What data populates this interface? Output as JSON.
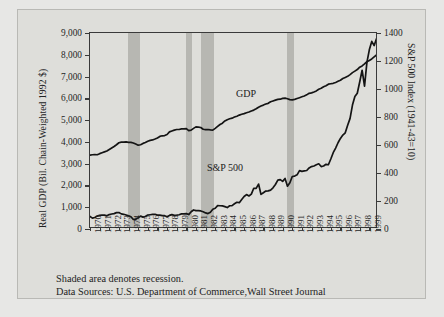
{
  "figure": {
    "labels": {
      "gdp_series_label": "GDP",
      "sp_series_label": "S&P 500"
    },
    "notes": {
      "line1": "Shaded area denotes recession.",
      "line2": "Data Sources: U.S. Department of Commerce,Wall Street Journal"
    },
    "colors": {
      "panel_background": "#dededa",
      "page_background": "#e7e7e5",
      "recession_band": "#b7b7b2",
      "line": "#141414",
      "axis": "#3a3a3a"
    }
  },
  "chart_data": {
    "type": "line",
    "title": "",
    "xlabel": "",
    "ylabel": "Real GDP (Bil. Chain-Weighted 1992 $)",
    "y2label": "S&P 500 Index (1941-43=10)",
    "grid": false,
    "legend": "inline-annotations",
    "xlim": [
      1970,
      1999.9
    ],
    "ylim": [
      0,
      9000
    ],
    "y2lim": [
      0,
      1400
    ],
    "yticks": [
      0,
      1000,
      2000,
      3000,
      4000,
      5000,
      6000,
      7000,
      8000,
      9000
    ],
    "yticklabels": [
      "0",
      "1,000",
      "2,000",
      "3,000",
      "4,000",
      "5,000",
      "6,000",
      "7,000",
      "8,000",
      "9,000"
    ],
    "y2ticks": [
      0,
      200,
      400,
      600,
      800,
      1000,
      1200,
      1400
    ],
    "y2ticklabels": [
      "0",
      "200",
      "400",
      "600",
      "800",
      "1000",
      "1200",
      "1400"
    ],
    "xticklabels": [
      "1970",
      "1971",
      "1972",
      "1973",
      "1974",
      "1975",
      "1976",
      "1977",
      "1978",
      "1979",
      "1980",
      "1981",
      "1982",
      "1983",
      "1984",
      "1985",
      "1986",
      "1987",
      "1988",
      "1989",
      "1990",
      "1991",
      "1992",
      "1993",
      "1994",
      "1995",
      "1996",
      "1997",
      "1998",
      "1999"
    ],
    "recessions": [
      {
        "start": 1973.9,
        "end": 1975.2
      },
      {
        "start": 1980.0,
        "end": 1980.6
      },
      {
        "start": 1981.5,
        "end": 1982.9
      },
      {
        "start": 1990.5,
        "end": 1991.2
      }
    ],
    "series": [
      {
        "name": "GDP",
        "axis": "left",
        "units": "Bil. Chain-Weighted 1992 $",
        "x": [
          1970.0,
          1970.25,
          1970.5,
          1970.75,
          1971.0,
          1971.25,
          1971.5,
          1971.75,
          1972.0,
          1972.25,
          1972.5,
          1972.75,
          1973.0,
          1973.25,
          1973.5,
          1973.75,
          1974.0,
          1974.25,
          1974.5,
          1974.75,
          1975.0,
          1975.25,
          1975.5,
          1975.75,
          1976.0,
          1976.25,
          1976.5,
          1976.75,
          1977.0,
          1977.25,
          1977.5,
          1977.75,
          1978.0,
          1978.25,
          1978.5,
          1978.75,
          1979.0,
          1979.25,
          1979.5,
          1979.75,
          1980.0,
          1980.25,
          1980.5,
          1980.75,
          1981.0,
          1981.25,
          1981.5,
          1981.75,
          1982.0,
          1982.25,
          1982.5,
          1982.75,
          1983.0,
          1983.25,
          1983.5,
          1983.75,
          1984.0,
          1984.25,
          1984.5,
          1984.75,
          1985.0,
          1985.25,
          1985.5,
          1985.75,
          1986.0,
          1986.25,
          1986.5,
          1986.75,
          1987.0,
          1987.25,
          1987.5,
          1987.75,
          1988.0,
          1988.25,
          1988.5,
          1988.75,
          1989.0,
          1989.25,
          1989.5,
          1989.75,
          1990.0,
          1990.25,
          1990.5,
          1990.75,
          1991.0,
          1991.25,
          1991.5,
          1991.75,
          1992.0,
          1992.25,
          1992.5,
          1992.75,
          1993.0,
          1993.25,
          1993.5,
          1993.75,
          1994.0,
          1994.25,
          1994.5,
          1994.75,
          1995.0,
          1995.25,
          1995.5,
          1995.75,
          1996.0,
          1996.25,
          1996.5,
          1996.75,
          1997.0,
          1997.25,
          1997.5,
          1997.75,
          1998.0,
          1998.25,
          1998.5,
          1998.75,
          1999.0,
          1999.25,
          1999.5,
          1999.75
        ],
        "y": [
          3390,
          3410,
          3420,
          3410,
          3460,
          3500,
          3540,
          3580,
          3650,
          3720,
          3790,
          3870,
          3960,
          3990,
          3990,
          4000,
          3980,
          3980,
          3950,
          3900,
          3850,
          3870,
          3930,
          3970,
          4030,
          4070,
          4090,
          4130,
          4180,
          4250,
          4280,
          4290,
          4340,
          4460,
          4500,
          4540,
          4570,
          4570,
          4600,
          4600,
          4610,
          4520,
          4540,
          4620,
          4690,
          4680,
          4660,
          4580,
          4560,
          4570,
          4550,
          4540,
          4620,
          4710,
          4800,
          4860,
          4960,
          5020,
          5060,
          5090,
          5140,
          5180,
          5230,
          5270,
          5300,
          5340,
          5370,
          5420,
          5460,
          5520,
          5590,
          5650,
          5690,
          5740,
          5770,
          5840,
          5880,
          5920,
          5950,
          5960,
          6000,
          6010,
          5980,
          5940,
          5930,
          5950,
          5990,
          6030,
          6070,
          6110,
          6160,
          6230,
          6250,
          6290,
          6340,
          6420,
          6460,
          6530,
          6580,
          6650,
          6670,
          6690,
          6730,
          6780,
          6830,
          6910,
          6960,
          7010,
          7090,
          7180,
          7250,
          7320,
          7430,
          7490,
          7580,
          7680,
          7740,
          7810,
          7900,
          7990
        ]
      },
      {
        "name": "S&P 500",
        "axis": "right",
        "units": "Index (1941-43=10)",
        "x": [
          1970.0,
          1970.25,
          1970.5,
          1970.75,
          1971.0,
          1971.25,
          1971.5,
          1971.75,
          1972.0,
          1972.25,
          1972.5,
          1972.75,
          1973.0,
          1973.25,
          1973.5,
          1973.75,
          1974.0,
          1974.25,
          1974.5,
          1974.75,
          1975.0,
          1975.25,
          1975.5,
          1975.75,
          1976.0,
          1976.25,
          1976.5,
          1976.75,
          1977.0,
          1977.25,
          1977.5,
          1977.75,
          1978.0,
          1978.25,
          1978.5,
          1978.75,
          1979.0,
          1979.25,
          1979.5,
          1979.75,
          1980.0,
          1980.25,
          1980.5,
          1980.75,
          1981.0,
          1981.25,
          1981.5,
          1981.75,
          1982.0,
          1982.25,
          1982.5,
          1982.75,
          1983.0,
          1983.25,
          1983.5,
          1983.75,
          1984.0,
          1984.25,
          1984.5,
          1984.75,
          1985.0,
          1985.25,
          1985.5,
          1985.75,
          1986.0,
          1986.25,
          1986.5,
          1986.75,
          1987.0,
          1987.25,
          1987.5,
          1987.75,
          1988.0,
          1988.25,
          1988.5,
          1988.75,
          1989.0,
          1989.25,
          1989.5,
          1989.75,
          1990.0,
          1990.25,
          1990.5,
          1990.75,
          1991.0,
          1991.25,
          1991.5,
          1991.75,
          1992.0,
          1992.25,
          1992.5,
          1992.75,
          1993.0,
          1993.25,
          1993.5,
          1993.75,
          1994.0,
          1994.25,
          1994.5,
          1994.75,
          1995.0,
          1995.25,
          1995.5,
          1995.75,
          1996.0,
          1996.25,
          1996.5,
          1996.75,
          1997.0,
          1997.25,
          1997.5,
          1997.75,
          1998.0,
          1998.25,
          1998.5,
          1998.75,
          1999.0,
          1999.25,
          1999.5,
          1999.75
        ],
        "y": [
          90,
          78,
          82,
          92,
          97,
          100,
          99,
          94,
          103,
          107,
          110,
          117,
          118,
          108,
          105,
          100,
          94,
          88,
          68,
          70,
          80,
          92,
          85,
          89,
          100,
          102,
          104,
          105,
          99,
          99,
          96,
          95,
          88,
          97,
          103,
          97,
          99,
          102,
          108,
          108,
          110,
          103,
          123,
          136,
          131,
          131,
          129,
          123,
          115,
          110,
          120,
          141,
          148,
          167,
          166,
          165,
          160,
          153,
          166,
          167,
          180,
          191,
          188,
          211,
          232,
          246,
          236,
          249,
          291,
          290,
          321,
          247,
          259,
          271,
          272,
          278,
          294,
          318,
          349,
          353,
          340,
          361,
          306,
          330,
          375,
          378,
          387,
          417,
          412,
          415,
          418,
          436,
          446,
          450,
          459,
          466,
          446,
          450,
          462,
          459,
          500,
          545,
          578,
          616,
          647,
          671,
          687,
          741,
          790,
          885,
          947,
          970,
          1050,
          1134,
          1020,
          1190,
          1280,
          1340,
          1310,
          1360
        ]
      }
    ]
  }
}
